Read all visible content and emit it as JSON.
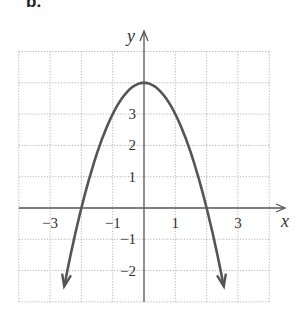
{
  "panel_label": "b.",
  "chart_data": {
    "type": "line",
    "title": "",
    "panel": "b.",
    "function": "y = 4 - x^2",
    "xlabel": "x",
    "ylabel": "y",
    "xlim": [
      -4,
      4
    ],
    "ylim": [
      -3,
      5
    ],
    "grid": true,
    "x_ticks": [
      {
        "value": -3,
        "label": "−3"
      },
      {
        "value": -1,
        "label": "−1"
      },
      {
        "value": 1,
        "label": "1"
      },
      {
        "value": 3,
        "label": "3"
      }
    ],
    "y_ticks": [
      {
        "value": 3,
        "label": "3"
      },
      {
        "value": 2,
        "label": "2"
      },
      {
        "value": 1,
        "label": "1"
      },
      {
        "value": -1,
        "label": "−1"
      },
      {
        "value": -2,
        "label": "−2"
      }
    ],
    "series": [
      {
        "name": "parabola",
        "x": [
          -2.5,
          -2,
          -1.5,
          -1,
          -0.5,
          0,
          0.5,
          1,
          1.5,
          2,
          2.5
        ],
        "y": [
          -2.25,
          0,
          1.75,
          3,
          3.75,
          4,
          3.75,
          3,
          1.75,
          0,
          -2.25
        ],
        "arrows_at_ends": true,
        "color": "#555555"
      }
    ],
    "key_points": {
      "vertex": [
        0,
        4
      ],
      "x_intercepts": [
        -2,
        2
      ],
      "y_intercept": 4
    }
  }
}
